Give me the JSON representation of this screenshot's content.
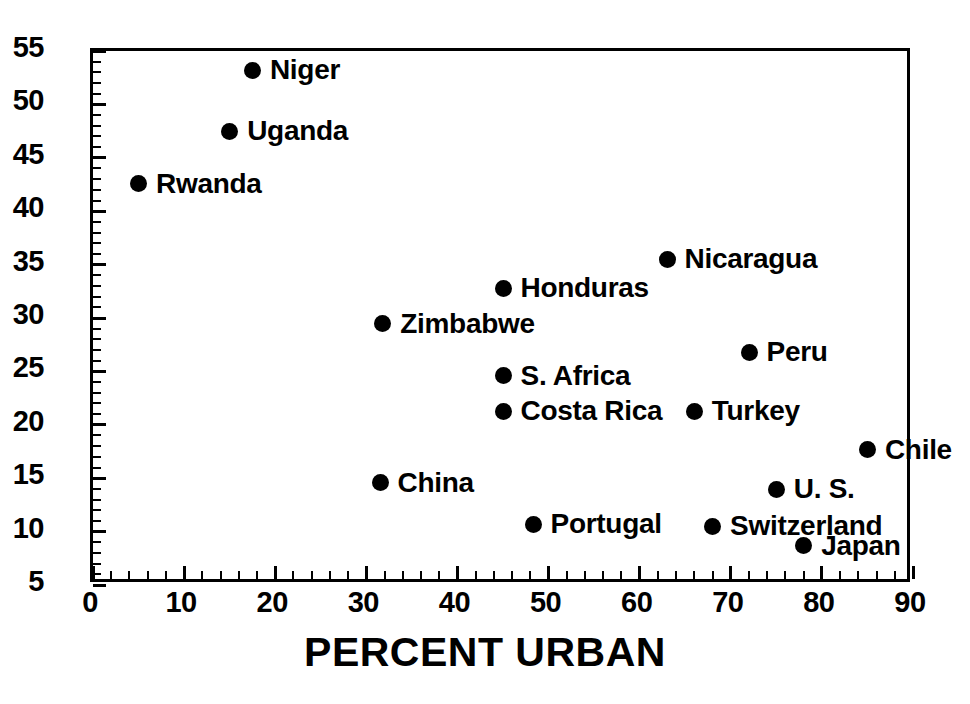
{
  "chart_data": {
    "type": "scatter",
    "title": "",
    "xlabel": "PERCENT URBAN",
    "ylabel": "",
    "xlim": [
      0,
      90
    ],
    "ylim": [
      5,
      55
    ],
    "xticks": [
      0,
      10,
      20,
      30,
      40,
      50,
      60,
      70,
      80,
      90
    ],
    "yticks": [
      5,
      10,
      15,
      20,
      25,
      30,
      35,
      40,
      45,
      50,
      55
    ],
    "x_minor_tick_step": 2,
    "y_minor_tick_step": 1,
    "grid": false,
    "legend": false,
    "marker_color": "#000000",
    "frame_color": "#000000",
    "background": "#ffffff",
    "points": [
      {
        "label": "Niger",
        "x": 17.5,
        "y": 53.7
      },
      {
        "label": "Uganda",
        "x": 15.0,
        "y": 48.0
      },
      {
        "label": "Rwanda",
        "x": 5.0,
        "y": 43.1
      },
      {
        "label": "Nicaragua",
        "x": 63.0,
        "y": 36.0
      },
      {
        "label": "Honduras",
        "x": 45.0,
        "y": 33.3
      },
      {
        "label": "Zimbabwe",
        "x": 31.8,
        "y": 30.0
      },
      {
        "label": "Peru",
        "x": 72.0,
        "y": 27.3
      },
      {
        "label": "S. Africa",
        "x": 45.0,
        "y": 25.1
      },
      {
        "label": "Costa Rica",
        "x": 45.0,
        "y": 21.8
      },
      {
        "label": "Turkey",
        "x": 66.0,
        "y": 21.8
      },
      {
        "label": "Chile",
        "x": 85.0,
        "y": 18.2
      },
      {
        "label": "China",
        "x": 31.5,
        "y": 15.1
      },
      {
        "label": "U. S.",
        "x": 75.0,
        "y": 14.5
      },
      {
        "label": "Portugal",
        "x": 48.3,
        "y": 11.2
      },
      {
        "label": "Switzerland",
        "x": 68.0,
        "y": 11.0
      },
      {
        "label": "Japan",
        "x": 78.0,
        "y": 9.2
      }
    ],
    "label_placement": {
      "Rwanda": "right",
      "Niger": "right",
      "Uganda": "right",
      "Nicaragua": "right",
      "Honduras": "right",
      "Zimbabwe": "right",
      "Peru": "right",
      "S. Africa": "right",
      "Costa Rica": "right",
      "Turkey": "right",
      "Chile": "right",
      "China": "right",
      "U. S.": "right",
      "Portugal": "right",
      "Switzerland": "right",
      "Japan": "right"
    }
  }
}
